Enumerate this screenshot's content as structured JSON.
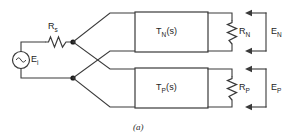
{
  "figure": {
    "caption": "(a)",
    "type": "circuit-schematic"
  },
  "source": {
    "symbol": "ac-source-sine",
    "label": "E",
    "label_sub": "i"
  },
  "series_resistor": {
    "symbol": "resistor-zigzag",
    "label": "R",
    "label_sub": "s"
  },
  "blocks": [
    {
      "name": "negative-branch-block",
      "label": "T",
      "label_sub": "N",
      "label_tail": "(s)"
    },
    {
      "name": "positive-branch-block",
      "label": "T",
      "label_sub": "P",
      "label_tail": "(s)"
    }
  ],
  "load_resistors": [
    {
      "name": "load-resistor-n",
      "symbol": "resistor-zigzag",
      "label": "R",
      "label_sub": "N"
    },
    {
      "name": "load-resistor-p",
      "symbol": "resistor-zigzag",
      "label": "R",
      "label_sub": "P"
    }
  ],
  "output_voltages": [
    {
      "name": "output-voltage-n",
      "label": "E",
      "label_sub": "N"
    },
    {
      "name": "output-voltage-p",
      "label": "E",
      "label_sub": "P"
    }
  ],
  "colors": {
    "line": "#3a3a3a",
    "text": "#1d1d1d",
    "background": "#ffffff"
  }
}
